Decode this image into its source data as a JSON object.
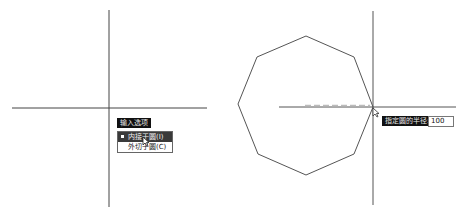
{
  "left_panel": {
    "prompt_label": "输入选项",
    "menu_items": [
      {
        "label": "内接于圆(I)",
        "selected": true
      },
      {
        "label": "外切于圆(C)",
        "selected": false
      }
    ]
  },
  "right_panel": {
    "prompt_label": "指定圆的半径:",
    "radius_value": "100"
  },
  "shape": {
    "type": "octagon",
    "stroke": "#555555"
  },
  "colors": {
    "line": "#444444",
    "tooltip_bg": "#111111",
    "menu_active": "#3a3a3a"
  }
}
